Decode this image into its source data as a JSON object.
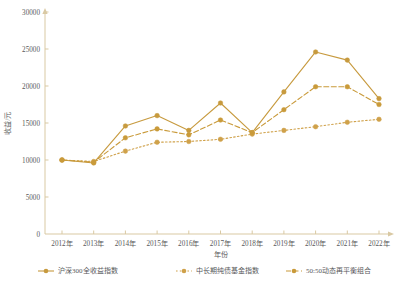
{
  "chart_data": {
    "type": "line",
    "title": "",
    "xlabel": "年份",
    "ylabel": "收益/元",
    "categories": [
      "2012年",
      "2013年",
      "2014年",
      "2015年",
      "2016年",
      "2017年",
      "2018年",
      "2019年",
      "2020年",
      "2021年",
      "2022年"
    ],
    "ylim": [
      0,
      30000
    ],
    "yticks": [
      0,
      5000,
      10000,
      15000,
      20000,
      25000,
      30000
    ],
    "ytick_labels": [
      "0",
      "5000",
      "10000",
      "15000",
      "20000",
      "25000",
      "30000"
    ],
    "grid": false,
    "legend_position": "bottom",
    "series": [
      {
        "name": "沪深300全收益指数",
        "color": "#c79a3e",
        "line_style": "solid",
        "marker": "circle",
        "values": [
          10000,
          9600,
          14600,
          16000,
          14000,
          17700,
          13700,
          19200,
          24600,
          23500,
          18300
        ]
      },
      {
        "name": "中长期纯债基金指数",
        "color": "#cfa14a",
        "line_style": "dotted",
        "marker": "circle",
        "values": [
          10000,
          9800,
          11200,
          12400,
          12500,
          12800,
          13500,
          14000,
          14500,
          15100,
          15500
        ]
      },
      {
        "name": "50:50动态再平衡组合",
        "color": "#c99a3a",
        "line_style": "dashed",
        "marker": "circle",
        "values": [
          10000,
          9700,
          13000,
          14200,
          13400,
          15400,
          13700,
          16800,
          19900,
          19900,
          17500
        ]
      }
    ]
  },
  "axes": {
    "y_axis_title": "收益/元",
    "x_axis_title": "年份"
  },
  "legend": {
    "items": [
      {
        "label": "沪深300全收益指数"
      },
      {
        "label": "中长期纯债基金指数"
      },
      {
        "label": "50:50动态再平衡组合"
      }
    ]
  },
  "colors": {
    "axis": "#d9c9a3",
    "text": "#58595b",
    "series1": "#c79a3e",
    "series2": "#cfa14a",
    "series3": "#c99a3a"
  }
}
